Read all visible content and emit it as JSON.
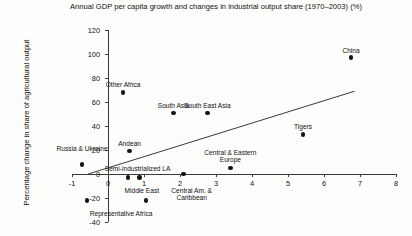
{
  "chart_data": {
    "type": "scatter",
    "title": "Annual GDP per capita growth and changes in industrial output share (1970–2003) (%)",
    "xlabel": "",
    "ylabel": "Percentage change in share of agricultural output",
    "xlim": [
      -1,
      8
    ],
    "ylim": [
      -40,
      120
    ],
    "xticks": [
      "-1",
      "0",
      "1",
      "2",
      "3",
      "4",
      "5",
      "6",
      "7",
      "8"
    ],
    "xtick_values": [
      -1,
      0,
      1,
      2,
      3,
      4,
      5,
      6,
      7,
      8
    ],
    "yticks": [
      "120",
      "100",
      "80",
      "60",
      "40",
      "20",
      "0",
      "-20",
      "-40"
    ],
    "ytick_values": [
      120,
      100,
      80,
      60,
      40,
      20,
      0,
      -20,
      -40
    ],
    "grid": false,
    "legend": "none",
    "points": [
      {
        "label": "China",
        "x": 6.75,
        "y": 97,
        "label_dx": 0,
        "label_dy": -11,
        "lines": 1
      },
      {
        "label": "Other Africa",
        "x": 0.42,
        "y": 68,
        "label_dx": 0,
        "label_dy": -11,
        "lines": 1
      },
      {
        "label": "South Asia",
        "x": 1.82,
        "y": 51,
        "label_dx": 0,
        "label_dy": -11,
        "lines": 1
      },
      {
        "label": "South East Asia",
        "x": 2.76,
        "y": 51,
        "label_dx": 0,
        "label_dy": -11,
        "lines": 1
      },
      {
        "label": "Tigers",
        "x": 5.42,
        "y": 33,
        "label_dx": 0,
        "label_dy": -11,
        "lines": 1
      },
      {
        "label": "Andean",
        "x": 0.6,
        "y": 19,
        "label_dx": 0,
        "label_dy": -11,
        "lines": 1
      },
      {
        "label": "Central & Eastern Europe",
        "x": 3.4,
        "y": 5,
        "label_dx": 0,
        "label_dy": -19,
        "lines": 2
      },
      {
        "label": "Russia & Ukraine",
        "x": -0.72,
        "y": 8,
        "label_dx": 0,
        "label_dy": -19,
        "lines": 2
      },
      {
        "label": "Semi-industrialized LA",
        "x": 2.1,
        "y": 0,
        "label_dx": -46,
        "label_dy": -9,
        "lines": 1
      },
      {
        "label": "Middle East",
        "x": 0.55,
        "y": -3,
        "label_dx": 14,
        "label_dy": 9,
        "lines": 1
      },
      {
        "label": "Central Am. & Caribbean",
        "x": 0.88,
        "y": -3,
        "label_dx": 52,
        "label_dy": 9,
        "lines": 2
      },
      {
        "label": "Representative Africa",
        "x": -0.58,
        "y": -22,
        "label_dx": 34,
        "label_dy": 10,
        "lines": 1
      },
      {
        "label": "",
        "x": 1.06,
        "y": -22,
        "label_dx": 0,
        "label_dy": 0,
        "lines": 0
      }
    ],
    "trendline": {
      "x0": -0.55,
      "y0": 0,
      "x1": 6.85,
      "y1": 69
    },
    "colors": {
      "marker": "#151515",
      "axis": "#3a3a3a",
      "text": "#111111",
      "background": "#fdfdfb"
    }
  }
}
